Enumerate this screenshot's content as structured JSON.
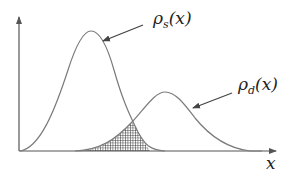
{
  "diagram": {
    "title": "",
    "axis": {
      "x_label": "x"
    },
    "curves": [
      {
        "name": "rho_s",
        "label_symbol": "ρ",
        "label_sub": "s",
        "label_arg": "(x)",
        "peak": [
          91,
          31
        ]
      },
      {
        "name": "rho_d",
        "label_symbol": "ρ",
        "label_sub": "d",
        "label_arg": "(x)",
        "peak": [
          165,
          92
        ]
      }
    ],
    "overlap_region": {
      "description": "hatched overlap area under both curves",
      "fill": "crosshatch"
    },
    "colors": {
      "curve": "#7a7a7a",
      "axis": "#555555",
      "arrow": "#444444",
      "hatch": "#333333"
    }
  }
}
